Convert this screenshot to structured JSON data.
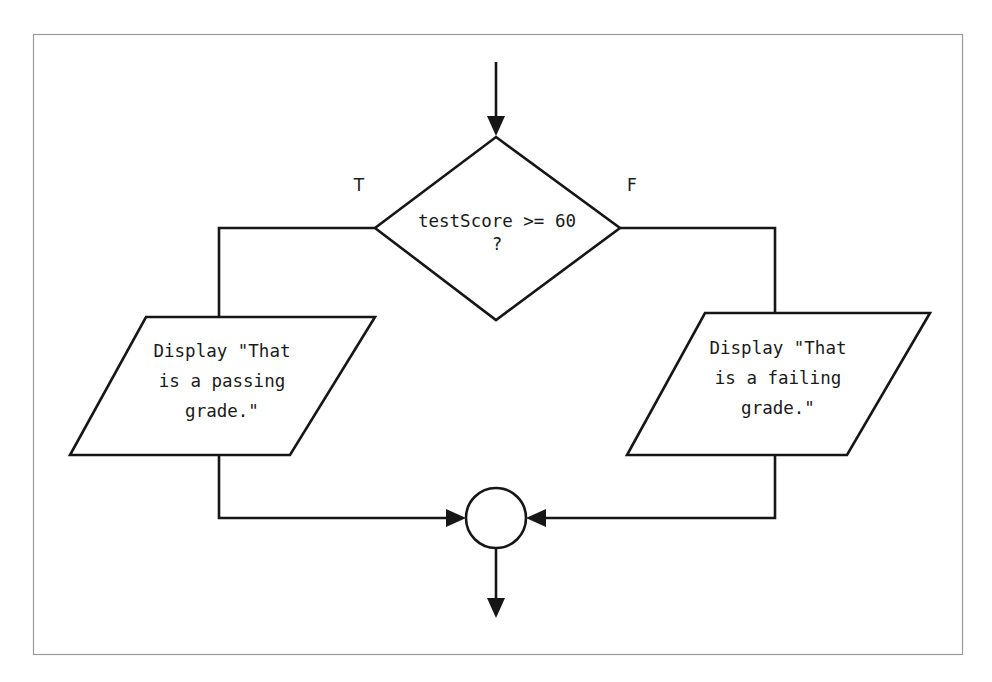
{
  "diagram": {
    "background_color": "#ffffff",
    "frame_color": "#9a9a9a",
    "line_color": "#161616",
    "shape_fill": "#ffffff"
  },
  "decision": {
    "line1": "testScore >= 60",
    "line2": "?"
  },
  "branch_labels": {
    "true_label": "T",
    "false_label": "F"
  },
  "process_true": {
    "line1": "Display \"That",
    "line2": "is a passing",
    "line3": "grade.\""
  },
  "process_false": {
    "line1": "Display \"That",
    "line2": "is a failing",
    "line3": "grade.\""
  },
  "connector": {
    "label": ""
  }
}
